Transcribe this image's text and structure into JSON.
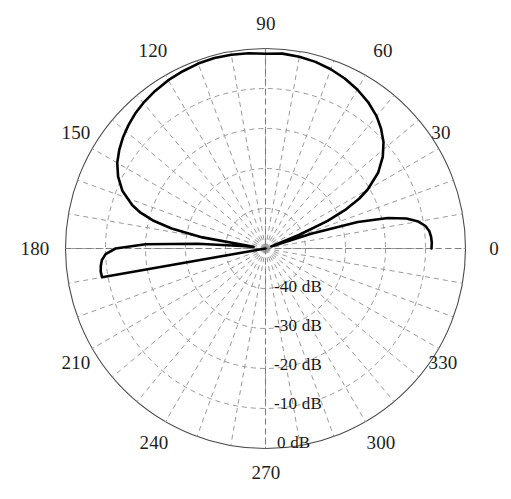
{
  "figure": {
    "title_visible_fragment": ""
  },
  "chart_data": {
    "type": "line",
    "subtype": "polar-radiation-pattern",
    "title": "",
    "xlabel": "",
    "ylabel": "",
    "grid": true,
    "legend": null,
    "angle_unit": "degrees",
    "angle_labels": [
      "0",
      "30",
      "60",
      "90",
      "120",
      "150",
      "180",
      "210",
      "240",
      "270",
      "300",
      "330"
    ],
    "angle_tick_step_major": 30,
    "angle_tick_step_minor": 10,
    "radial_labels": [
      "-40 dB",
      "-30 dB",
      "-20 dB",
      "-10 dB",
      "0 dB"
    ],
    "radial_values": [
      -40,
      -30,
      -20,
      -10,
      0
    ],
    "rlim": [
      -50,
      0
    ],
    "r_center_value": -50,
    "r_outer_value": 0,
    "radial_label_angle": 270,
    "series": [
      {
        "name": "Radiation pattern",
        "color": "#000000",
        "line_width": 2.6,
        "theta": [
          0,
          2,
          4,
          6,
          8,
          10,
          12,
          14,
          16,
          18,
          20,
          22,
          24,
          26,
          28,
          30,
          34,
          38,
          42,
          46,
          50,
          55,
          60,
          65,
          70,
          75,
          80,
          85,
          90,
          95,
          100,
          105,
          110,
          115,
          120,
          125,
          130,
          134,
          138,
          142,
          146,
          150,
          154,
          158,
          162,
          164,
          166,
          168,
          170,
          172,
          174,
          176,
          178,
          180,
          182,
          184,
          186,
          188,
          190,
          192,
          194,
          196,
          198,
          200,
          205,
          210,
          215,
          220,
          225,
          230,
          235,
          240,
          245,
          250,
          255,
          260,
          265,
          270,
          275,
          280,
          285,
          290,
          295,
          300,
          305,
          310,
          315,
          320,
          325,
          330,
          335,
          340,
          345,
          350,
          352,
          354,
          356,
          358,
          360
        ],
        "r_db": [
          -8.5,
          -8.4,
          -8.5,
          -8.8,
          -9.6,
          -11.2,
          -14.0,
          -18.5,
          -26.0,
          -38.0,
          -48.5,
          -41.0,
          -33.0,
          -27.5,
          -23.5,
          -20.5,
          -16.0,
          -12.8,
          -10.3,
          -8.4,
          -6.8,
          -5.3,
          -4.1,
          -3.1,
          -2.3,
          -1.7,
          -1.3,
          -1.1,
          -1.3,
          -1.0,
          -0.8,
          -0.7,
          -0.8,
          -1.1,
          -1.4,
          -1.9,
          -2.5,
          -3.1,
          -3.9,
          -4.8,
          -5.9,
          -7.2,
          -9.0,
          -11.4,
          -15.0,
          -17.5,
          -21.0,
          -26.0,
          -34.0,
          -47.0,
          -44.0,
          -33.0,
          -20.0,
          -12.5,
          -10.0,
          -9.0,
          -8.6,
          -8.4,
          -8.5,
          -50.0,
          -50.0,
          -50.0,
          -50.0,
          -50.0,
          -50.0,
          -50.0,
          -50.0,
          -50.0,
          -50.0,
          -50.0,
          -50.0,
          -50.0,
          -50.0,
          -50.0,
          -50.0,
          -50.0,
          -50.0,
          -50.0,
          -50.0,
          -50.0,
          -50.0,
          -50.0,
          -50.0,
          -50.0,
          -50.0,
          -50.0,
          -50.0,
          -50.0,
          -50.0,
          -50.0,
          -50.0,
          -50.0,
          -50.0,
          -50.0,
          -50.0,
          -50.0,
          -50.0,
          -50.0,
          -8.5
        ],
        "notes": "Main lobe peak approx -0.7 dB near 100 deg; deep nulls near 20 deg and 172 deg; side lobes near 0 deg and 180 deg at about -8.5 dB; lower half-plane (190-350 deg) not plotted."
      }
    ],
    "features": {
      "main_lobe_peak_db": -0.7,
      "main_lobe_peak_angle_deg": 100,
      "null_angles_deg": [
        20,
        172
      ],
      "sidelobe_level_db": -8.5,
      "plotted_angular_range_deg": [
        0,
        190
      ]
    }
  },
  "axes": {
    "outer_circle_color": "#4a4a4a",
    "grid_color": "#9a9a9a",
    "grid_style": "dashed",
    "trace_color": "#000000",
    "background": "#ffffff"
  },
  "angle_label_positions": [
    {
      "label": "0",
      "x": 494,
      "y": 249
    },
    {
      "label": "30",
      "x": 441,
      "y": 133
    },
    {
      "label": "60",
      "x": 383,
      "y": 51
    },
    {
      "label": "90",
      "x": 266,
      "y": 24
    },
    {
      "label": "120",
      "x": 153,
      "y": 51
    },
    {
      "label": "150",
      "x": 76,
      "y": 133
    },
    {
      "label": "180",
      "x": 35,
      "y": 249
    },
    {
      "label": "210",
      "x": 76,
      "y": 363
    },
    {
      "label": "240",
      "x": 154,
      "y": 443
    },
    {
      "label": "270",
      "x": 266,
      "y": 473
    },
    {
      "label": "300",
      "x": 381,
      "y": 443
    },
    {
      "label": "330",
      "x": 443,
      "y": 363
    }
  ],
  "radial_label_positions": [
    {
      "label": "-40 dB",
      "x": 274,
      "y": 287
    },
    {
      "label": "-30 dB",
      "x": 274,
      "y": 326
    },
    {
      "label": "-20 dB",
      "x": 274,
      "y": 365
    },
    {
      "label": "-10 dB",
      "x": 274,
      "y": 404
    },
    {
      "label": "0 dB",
      "x": 277,
      "y": 443
    }
  ]
}
